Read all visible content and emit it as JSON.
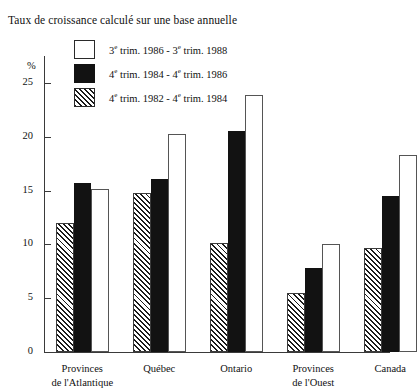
{
  "figure": {
    "subtitle": "Taux de croissance calculé sur une base annuelle",
    "unit_label": "%"
  },
  "legend": [
    {
      "swatch": "white",
      "label_prefix": "3",
      "label_sup": "e",
      "label": "3e trim. 1986 - 3e trim. 1988",
      "label_parts": [
        "3",
        "e",
        " trim. 1986 - 3",
        "e",
        " trim. 1988"
      ]
    },
    {
      "swatch": "black",
      "label_prefix": "4",
      "label_sup": "e",
      "label": "4e trim. 1984 - 4e trim. 1986",
      "label_parts": [
        "4",
        "e",
        " trim. 1984 - 4",
        "e",
        " trim. 1986"
      ]
    },
    {
      "swatch": "hatch",
      "label_prefix": "4",
      "label_sup": "e",
      "label": "4e trim. 1982 - 4e trim. 1984",
      "label_parts": [
        "4",
        "e",
        " trim. 1982 - 4",
        "e",
        " trim. 1984"
      ]
    }
  ],
  "axis": {
    "ticks": [
      "25",
      "20",
      "15",
      "10",
      "5",
      "0"
    ],
    "tick_values": [
      25,
      20,
      15,
      10,
      5,
      0
    ]
  },
  "categories": [
    {
      "line1": "Provinces",
      "line2": "de l'Atlantique"
    },
    {
      "line1": "Québec",
      "line2": ""
    },
    {
      "line1": "Ontario",
      "line2": ""
    },
    {
      "line1": "Provinces",
      "line2": "de l'Ouest"
    },
    {
      "line1": "Canada",
      "line2": ""
    }
  ],
  "chart_data": {
    "type": "bar",
    "title": "",
    "subtitle": "Taux de croissance calculé sur une base annuelle",
    "xlabel": "",
    "ylabel": "%",
    "ylim": [
      0,
      27.5
    ],
    "yticks": [
      0,
      5,
      10,
      15,
      20,
      25
    ],
    "grid": false,
    "legend_position": "top-left",
    "categories": [
      "Provinces de l'Atlantique",
      "Québec",
      "Ontario",
      "Provinces de l'Ouest",
      "Canada"
    ],
    "series_order_in_group": [
      "4e trim. 1982 - 4e trim. 1984",
      "4e trim. 1984 - 4e trim. 1986",
      "3e trim. 1986 - 3e trim. 1988"
    ],
    "series": [
      {
        "name": "3e trim. 1986 - 3e trim. 1988",
        "style": "white",
        "values": [
          15.1,
          20.3,
          23.9,
          10.0,
          18.3
        ]
      },
      {
        "name": "4e trim. 1984 - 4e trim. 1986",
        "style": "black",
        "values": [
          15.7,
          16.1,
          20.5,
          7.8,
          14.5
        ]
      },
      {
        "name": "4e trim. 1982 - 4e trim. 1984",
        "style": "hatch",
        "values": [
          12.0,
          14.8,
          10.1,
          5.5,
          9.7
        ]
      }
    ]
  }
}
